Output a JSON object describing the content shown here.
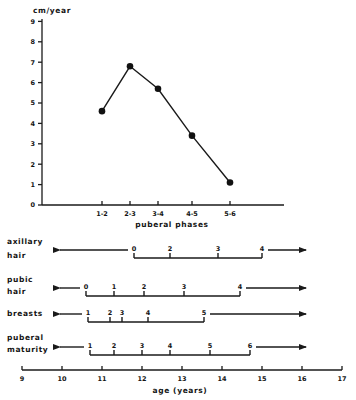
{
  "chart_data": [
    {
      "type": "line",
      "title": "",
      "ylabel": "cm/year",
      "xlabel": "puberal phases",
      "ylim": [
        0,
        9
      ],
      "yticks": [
        "0",
        "1",
        "2",
        "3",
        "4",
        "5",
        "6",
        "7",
        "8",
        "9"
      ],
      "categories": [
        "1-2",
        "2-3",
        "3-4",
        "4-5",
        "5-6"
      ],
      "x_positions_age": [
        11.0,
        11.7,
        12.4,
        13.25,
        14.2
      ],
      "series": [
        {
          "name": "growth velocity",
          "values": [
            4.6,
            6.8,
            5.7,
            3.4,
            1.1
          ],
          "marker": "filled-circle"
        }
      ],
      "grid": false
    },
    {
      "type": "timeline",
      "xlabel": "age (years)",
      "xlim": [
        9,
        17
      ],
      "xticks": [
        "9",
        "10",
        "11",
        "12",
        "13",
        "14",
        "15",
        "16",
        "17"
      ],
      "rows": [
        {
          "label": [
            "axillary",
            "hair"
          ],
          "stages": [
            "0",
            "2",
            "3",
            "4"
          ],
          "ages": [
            11.8,
            12.7,
            13.9,
            15.0
          ]
        },
        {
          "label": [
            "pubic",
            "hair"
          ],
          "stages": [
            "0",
            "1",
            "2",
            "3",
            "4"
          ],
          "ages": [
            10.6,
            11.3,
            12.05,
            13.05,
            14.45
          ]
        },
        {
          "label": [
            "breasts"
          ],
          "stages": [
            "1",
            "2",
            "3",
            "4",
            "5"
          ],
          "ages": [
            10.65,
            11.2,
            11.5,
            12.15,
            13.55
          ]
        },
        {
          "label": [
            "puberal",
            "maturity"
          ],
          "stages": [
            "1",
            "2",
            "3",
            "4",
            "5",
            "6"
          ],
          "ages": [
            10.7,
            11.3,
            12.0,
            12.7,
            13.7,
            14.7
          ]
        }
      ]
    }
  ]
}
